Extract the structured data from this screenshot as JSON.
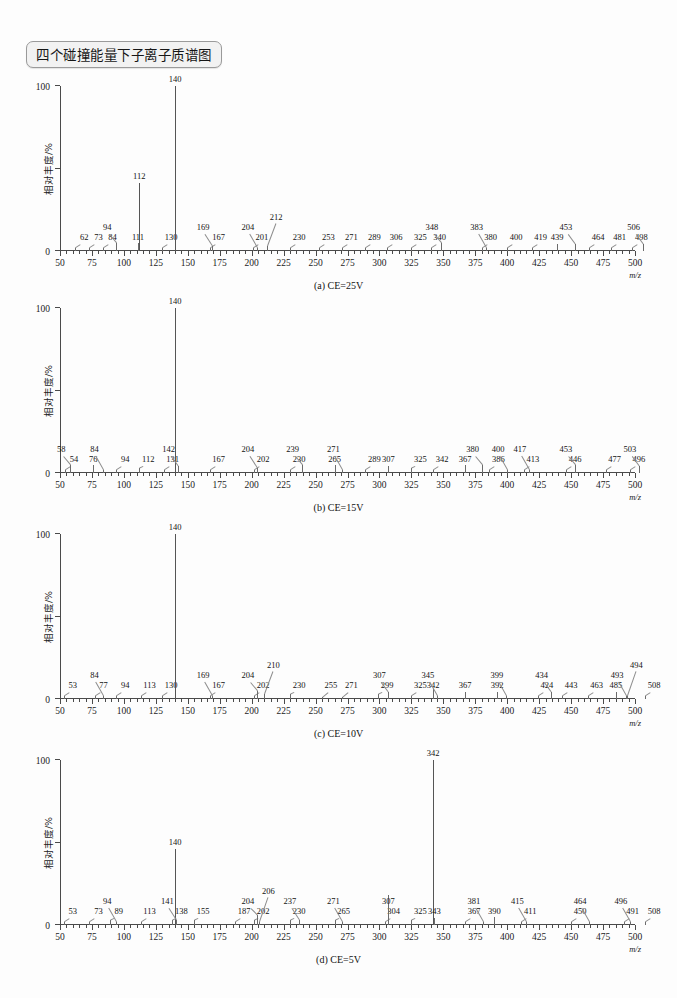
{
  "figure": {
    "title": "四个碰撞能量下子离子质谱图",
    "y_axis_title": "相对丰度/%",
    "x_axis_unit": "m/z"
  },
  "chart_data": [
    {
      "type": "bar",
      "id": "a",
      "title": "(a) CE=25V",
      "xlabel": "m/z",
      "ylabel": "相对丰度/%",
      "xlim": [
        50,
        500
      ],
      "ylim": [
        0,
        100
      ],
      "xticks": [
        50,
        75,
        100,
        125,
        150,
        175,
        200,
        225,
        250,
        275,
        300,
        325,
        350,
        375,
        400,
        425,
        450,
        475,
        500
      ],
      "yticks": [
        0,
        50,
        100
      ],
      "ytick_labels": [
        "0",
        "",
        "100"
      ],
      "grid": false,
      "legend": false,
      "x": [
        62,
        73,
        84,
        94,
        111,
        112,
        130,
        140,
        167,
        169,
        201,
        204,
        212,
        230,
        253,
        271,
        289,
        306,
        325,
        340,
        348,
        380,
        383,
        400,
        419,
        439,
        453,
        464,
        481,
        498,
        506
      ],
      "values": [
        2,
        2,
        2,
        5,
        5,
        41,
        2,
        100,
        2,
        3,
        2,
        2,
        3,
        2,
        2,
        2,
        2,
        2,
        2,
        2,
        5,
        2,
        2,
        2,
        2,
        4,
        4,
        2,
        2,
        2,
        4
      ],
      "labels": [
        "62",
        "73",
        "84",
        "94",
        "111",
        "112",
        "130",
        "140",
        "167",
        "169",
        "201",
        "204",
        "212",
        "230",
        "253",
        "271",
        "289",
        "306",
        "325",
        "340",
        "348",
        "380",
        "383",
        "400",
        "419",
        "439",
        "453",
        "464",
        "481",
        "498",
        "506"
      ]
    },
    {
      "type": "bar",
      "id": "b",
      "title": "(b) CE=15V",
      "xlabel": "m/z",
      "ylabel": "相对丰度/%",
      "xlim": [
        50,
        500
      ],
      "ylim": [
        0,
        100
      ],
      "xticks": [
        50,
        75,
        100,
        125,
        150,
        175,
        200,
        225,
        250,
        275,
        300,
        325,
        350,
        375,
        400,
        425,
        450,
        475,
        500
      ],
      "yticks": [
        0,
        50,
        100
      ],
      "ytick_labels": [
        "0",
        "",
        "100"
      ],
      "grid": false,
      "legend": false,
      "x": [
        54,
        58,
        76,
        84,
        94,
        112,
        131,
        140,
        142,
        167,
        202,
        204,
        230,
        239,
        265,
        271,
        289,
        307,
        325,
        342,
        367,
        380,
        386,
        400,
        413,
        417,
        446,
        453,
        477,
        496,
        503
      ],
      "values": [
        2,
        5,
        5,
        2,
        2,
        3,
        2,
        100,
        4,
        2,
        2,
        3,
        2,
        5,
        5,
        2,
        2,
        4,
        3,
        2,
        5,
        5,
        2,
        2,
        2,
        2,
        2,
        5,
        2,
        2,
        4
      ],
      "labels": [
        "54",
        "58",
        "76",
        "84",
        "94",
        "112",
        "131",
        "140",
        "142",
        "167",
        "202",
        "204",
        "230",
        "239",
        "265",
        "271",
        "289",
        "307",
        "325",
        "342",
        "367",
        "380",
        "386",
        "400",
        "413",
        "417",
        "446",
        "453",
        "477",
        "496",
        "503"
      ]
    },
    {
      "type": "bar",
      "id": "c",
      "title": "(c) CE=10V",
      "xlabel": "m/z",
      "ylabel": "相对丰度/%",
      "xlim": [
        50,
        500
      ],
      "ylim": [
        0,
        100
      ],
      "xticks": [
        50,
        75,
        100,
        125,
        150,
        175,
        200,
        225,
        250,
        275,
        300,
        325,
        350,
        375,
        400,
        425,
        450,
        475,
        500
      ],
      "yticks": [
        0,
        50,
        100
      ],
      "ytick_labels": [
        "0",
        "",
        "100"
      ],
      "grid": false,
      "legend": false,
      "x": [
        53,
        77,
        84,
        94,
        113,
        130,
        140,
        167,
        169,
        202,
        204,
        210,
        230,
        255,
        271,
        299,
        307,
        325,
        342,
        345,
        367,
        392,
        399,
        424,
        434,
        443,
        463,
        485,
        493,
        494,
        508
      ],
      "values": [
        2,
        2,
        2,
        2,
        2,
        2,
        100,
        2,
        2,
        2,
        5,
        3,
        3,
        1,
        1,
        3,
        4,
        2,
        6,
        2,
        4,
        4,
        2,
        2,
        4,
        2,
        2,
        4,
        2,
        2,
        2
      ],
      "labels": [
        "53",
        "77",
        "84",
        "94",
        "113",
        "130",
        "140",
        "167",
        "169",
        "202",
        "204",
        "210",
        "230",
        "255",
        "271",
        "299",
        "307",
        "325",
        "342",
        "345",
        "367",
        "392",
        "399",
        "424",
        "434",
        "443",
        "463",
        "485",
        "493",
        "494",
        "508"
      ]
    },
    {
      "type": "bar",
      "id": "d",
      "title": "(d) CE=5V",
      "xlabel": "m/z",
      "ylabel": "相对丰度/%",
      "xlim": [
        50,
        500
      ],
      "ylim": [
        0,
        100
      ],
      "xticks": [
        50,
        75,
        100,
        125,
        150,
        175,
        200,
        225,
        250,
        275,
        300,
        325,
        350,
        375,
        400,
        425,
        450,
        475,
        500
      ],
      "yticks": [
        0,
        50,
        100
      ],
      "ytick_labels": [
        "0",
        "",
        "100"
      ],
      "grid": false,
      "legend": false,
      "x": [
        53,
        73,
        89,
        94,
        113,
        138,
        140,
        141,
        155,
        187,
        202,
        204,
        206,
        230,
        237,
        265,
        271,
        304,
        307,
        325,
        342,
        343,
        367,
        381,
        390,
        411,
        415,
        450,
        464,
        491,
        496,
        508
      ],
      "values": [
        2,
        2,
        3,
        2,
        2,
        3,
        46,
        3,
        3,
        2,
        3,
        6,
        2,
        3,
        3,
        3,
        2,
        2,
        18,
        3,
        100,
        4,
        2,
        2,
        5,
        2,
        2,
        2,
        2,
        2,
        2,
        2
      ],
      "labels": [
        "53",
        "73",
        "89",
        "94",
        "113",
        "138",
        "140",
        "141",
        "155",
        "187",
        "202",
        "204",
        "206",
        "230",
        "237",
        "265",
        "271",
        "304",
        "307",
        "325",
        "342",
        "343",
        "367",
        "381",
        "390",
        "411",
        "415",
        "450",
        "464",
        "491",
        "496",
        "508"
      ]
    }
  ]
}
